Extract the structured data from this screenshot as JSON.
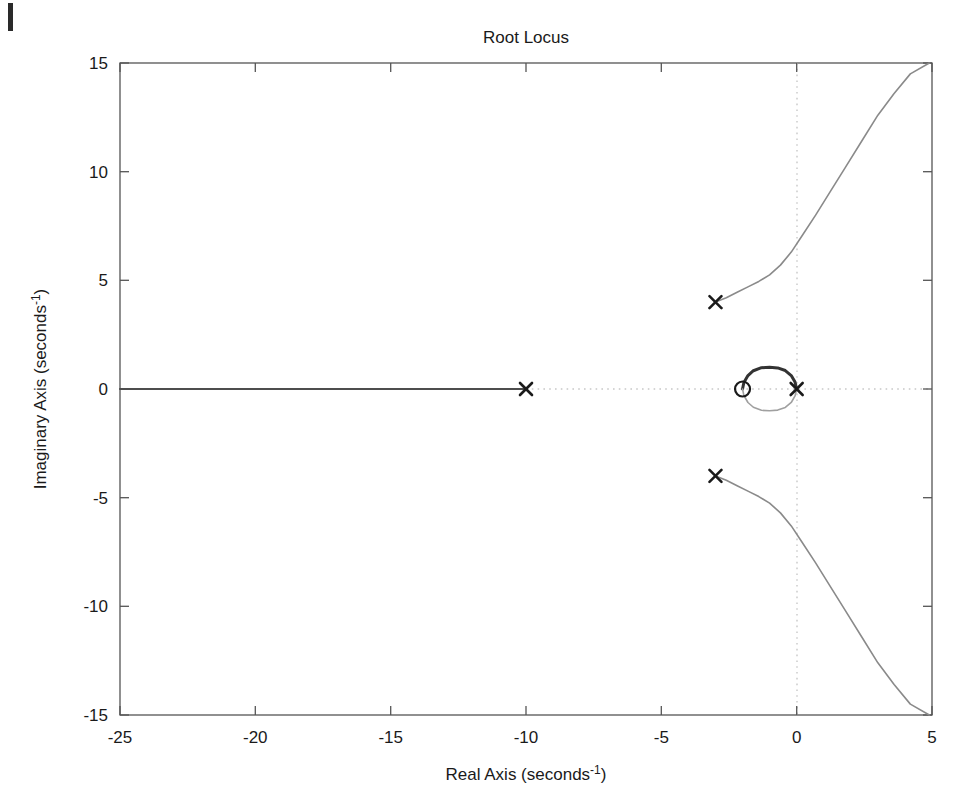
{
  "chart_data": {
    "type": "line",
    "title": "Root Locus",
    "xlabel": "Real Axis (seconds⁻¹)",
    "ylabel": "Imaginary Axis (seconds⁻¹)",
    "xlim": [
      -25,
      5
    ],
    "ylim": [
      -15,
      15
    ],
    "xticks": [
      -25,
      -20,
      -15,
      -10,
      -5,
      0,
      5
    ],
    "xticklabels": [
      "-25",
      "-20",
      "-15",
      "-10",
      "-5",
      "0",
      "5"
    ],
    "yticks": [
      -15,
      -10,
      -5,
      0,
      5,
      10,
      15
    ],
    "yticklabels": [
      "-15",
      "-10",
      "-5",
      "0",
      "5",
      "10",
      "15"
    ],
    "grid": false,
    "axis_lines": {
      "x_zero": true,
      "y_zero": true,
      "style": "dotted"
    },
    "legend": null,
    "markers": {
      "poles": [
        {
          "label": "x",
          "real": 0,
          "imag": 0
        },
        {
          "label": "x",
          "real": -10,
          "imag": 0
        },
        {
          "label": "x",
          "real": -3,
          "imag": 4
        },
        {
          "label": "x",
          "real": -3,
          "imag": -4
        }
      ],
      "zeros": [
        {
          "label": "o",
          "real": -2,
          "imag": 0
        }
      ]
    },
    "series": [
      {
        "name": "real-axis-branch",
        "color": "#4d4d4d",
        "points": [
          [
            -25,
            0
          ],
          [
            -22,
            0
          ],
          [
            -19,
            0
          ],
          [
            -16,
            0
          ],
          [
            -13,
            0
          ],
          [
            -10,
            0
          ]
        ]
      },
      {
        "name": "circular-branch-upper",
        "color": "#333333",
        "points": [
          [
            -2,
            0
          ],
          [
            -1.95,
            0.3
          ],
          [
            -1.8,
            0.62
          ],
          [
            -1.6,
            0.84
          ],
          [
            -1.3,
            0.98
          ],
          [
            -1.0,
            1.0
          ],
          [
            -0.7,
            0.97
          ],
          [
            -0.42,
            0.85
          ],
          [
            -0.2,
            0.62
          ],
          [
            -0.06,
            0.32
          ],
          [
            0,
            0
          ]
        ]
      },
      {
        "name": "circular-branch-lower",
        "color": "#a0a0a0",
        "points": [
          [
            -2,
            0
          ],
          [
            -1.95,
            -0.3
          ],
          [
            -1.8,
            -0.62
          ],
          [
            -1.6,
            -0.84
          ],
          [
            -1.3,
            -0.98
          ],
          [
            -1.0,
            -1.0
          ],
          [
            -0.7,
            -0.97
          ],
          [
            -0.42,
            -0.85
          ],
          [
            -0.2,
            -0.62
          ],
          [
            -0.06,
            -0.32
          ],
          [
            0,
            0
          ]
        ]
      },
      {
        "name": "complex-branch-upper",
        "color": "#8a8a8a",
        "points": [
          [
            -3,
            4
          ],
          [
            -2.6,
            4.2
          ],
          [
            -2.2,
            4.45
          ],
          [
            -1.8,
            4.7
          ],
          [
            -1.4,
            4.95
          ],
          [
            -1.0,
            5.25
          ],
          [
            -0.6,
            5.7
          ],
          [
            -0.2,
            6.3
          ],
          [
            0.2,
            7.05
          ],
          [
            0.7,
            8.0
          ],
          [
            1.2,
            9.0
          ],
          [
            1.8,
            10.2
          ],
          [
            2.4,
            11.4
          ],
          [
            3.0,
            12.6
          ],
          [
            3.6,
            13.6
          ],
          [
            4.2,
            14.5
          ],
          [
            4.9,
            15.0
          ]
        ]
      },
      {
        "name": "complex-branch-lower",
        "color": "#8a8a8a",
        "points": [
          [
            -3,
            -4
          ],
          [
            -2.6,
            -4.2
          ],
          [
            -2.2,
            -4.45
          ],
          [
            -1.8,
            -4.7
          ],
          [
            -1.4,
            -4.95
          ],
          [
            -1.0,
            -5.25
          ],
          [
            -0.6,
            -5.7
          ],
          [
            -0.2,
            -6.3
          ],
          [
            0.2,
            -7.05
          ],
          [
            0.7,
            -8.0
          ],
          [
            1.2,
            -9.0
          ],
          [
            1.8,
            -10.2
          ],
          [
            2.4,
            -11.4
          ],
          [
            3.0,
            -12.6
          ],
          [
            3.6,
            -13.6
          ],
          [
            4.2,
            -14.5
          ],
          [
            4.9,
            -15.0
          ]
        ]
      }
    ]
  },
  "figure": {
    "title": "Root Locus",
    "xlabel_main": "Real Axis (seconds",
    "xlabel_sup": "-1",
    "xlabel_tail": ")",
    "ylabel_main": "Imaginary Axis (seconds",
    "ylabel_sup": "-1",
    "ylabel_tail": ")",
    "xticklabels": [
      "-25",
      "-20",
      "-15",
      "-10",
      "-5",
      "0",
      "5"
    ],
    "yticklabels": [
      "15",
      "10",
      "5",
      "0",
      "-5",
      "-10",
      "-15"
    ],
    "colors": {
      "frame": "#555555",
      "dark_branch": "#333333",
      "mid_branch": "#8a8a8a",
      "light_branch": "#a0a0a0",
      "axis_dotted": "#c8c8c8",
      "text": "#1a1a1a",
      "background": "#ffffff"
    }
  }
}
